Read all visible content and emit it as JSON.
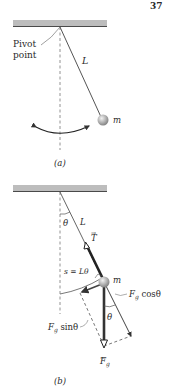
{
  "header": {
    "corner_text": "37"
  },
  "panel_a": {
    "caption": "(a)",
    "pivot_label_line1": "Pivot",
    "pivot_label_line2": "point",
    "length_label": "L",
    "mass_label": "m",
    "colors": {
      "ceiling": "#b9b9b9",
      "string": "#555555",
      "bob": "#a8a8a8",
      "swing_arrow": "#222222"
    }
  },
  "panel_b": {
    "caption": "(b)",
    "angle_label_top": "θ",
    "length_label": "L",
    "tension_label": "T",
    "arc_label": "s = Lθ",
    "mass_label": "m",
    "fg_cos_label": "F",
    "fg_cos_sub": "g",
    "fg_cos_tail": " cosθ",
    "fg_sin_label": "F",
    "fg_sin_sub": "g",
    "fg_sin_tail": " sinθ",
    "angle_label_bottom": "θ",
    "fg_label": "F",
    "fg_sub": "g",
    "colors": {
      "tension": "#222222",
      "gravity": "#444444",
      "component": "#555555",
      "dashed": "#666666"
    }
  }
}
